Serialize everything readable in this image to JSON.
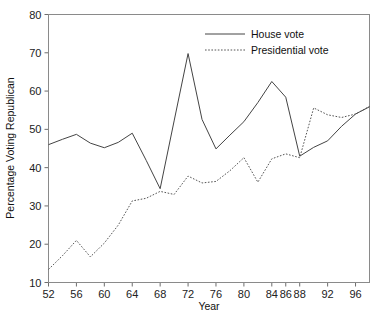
{
  "chart_data": {
    "type": "line",
    "title": "",
    "xlabel": "Year",
    "ylabel": "Percentage Voting Republican",
    "xlim": [
      52,
      98
    ],
    "ylim": [
      10,
      80
    ],
    "grid": false,
    "legend_position": "top-center-right",
    "x_tick_labels": [
      "52",
      "56",
      "60",
      "64",
      "68",
      "72",
      "76",
      "80",
      "84",
      "86",
      "88",
      "92",
      "96"
    ],
    "x_tick_values": [
      52,
      56,
      60,
      64,
      68,
      72,
      76,
      80,
      84,
      86,
      88,
      92,
      96
    ],
    "y_tick_labels": [
      "10",
      "20",
      "30",
      "40",
      "50",
      "60",
      "70",
      "80"
    ],
    "y_tick_values": [
      10,
      20,
      30,
      40,
      50,
      60,
      70,
      80
    ],
    "series": [
      {
        "name": "House vote",
        "style": "solid",
        "color": "#444444",
        "x": [
          52,
          54,
          56,
          58,
          60,
          62,
          64,
          66,
          68,
          70,
          72,
          74,
          76,
          78,
          80,
          82,
          84,
          86,
          88,
          90,
          92,
          94,
          96,
          98
        ],
        "values": [
          46.0,
          47.4,
          48.7,
          46.4,
          45.2,
          46.6,
          49.0,
          41.9,
          34.5,
          52.2,
          69.8,
          52.6,
          44.9,
          48.5,
          52.0,
          57.0,
          62.5,
          58.4,
          43.0,
          45.3,
          47.0,
          50.8,
          54.0,
          55.9
        ]
      },
      {
        "name": "Presidential vote",
        "style": "dotted",
        "color": "#555555",
        "x": [
          52,
          54,
          56,
          58,
          60,
          62,
          64,
          66,
          68,
          70,
          72,
          74,
          76,
          78,
          80,
          82,
          84,
          86,
          88,
          90,
          92,
          94,
          96,
          98
        ],
        "values": [
          13.4,
          17.0,
          21.0,
          16.7,
          20.3,
          25.0,
          31.3,
          32.0,
          33.8,
          33.0,
          37.8,
          36.0,
          36.4,
          39.2,
          42.6,
          36.2,
          42.3,
          43.6,
          42.6,
          55.6,
          53.8,
          53.1,
          54.0,
          56.0
        ]
      }
    ],
    "legend": [
      {
        "label": "House vote",
        "style": "solid"
      },
      {
        "label": "Presidential vote",
        "style": "dotted"
      }
    ]
  }
}
